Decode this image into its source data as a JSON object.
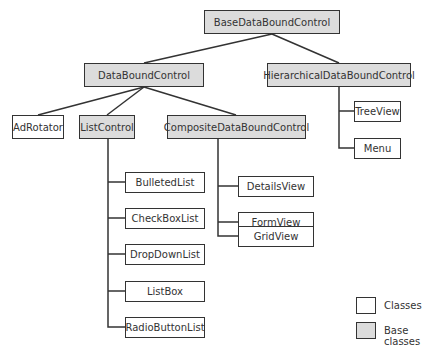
{
  "diagram": {
    "nodes": [
      {
        "id": "base",
        "label": "BaseDataBoundControl",
        "kind": "base",
        "x": 204,
        "y": 10,
        "w": 136,
        "h": 24
      },
      {
        "id": "dbc",
        "label": "DataBoundControl",
        "kind": "base",
        "x": 84,
        "y": 63,
        "w": 120,
        "h": 24
      },
      {
        "id": "hier",
        "label": "HierarchicalDataBoundControl",
        "kind": "base",
        "x": 267,
        "y": 63,
        "w": 144,
        "h": 24
      },
      {
        "id": "adrotator",
        "label": "AdRotator",
        "kind": "class",
        "x": 12,
        "y": 115,
        "w": 52,
        "h": 24
      },
      {
        "id": "listcontrol",
        "label": "ListControl",
        "kind": "base",
        "x": 79,
        "y": 115,
        "w": 56,
        "h": 24
      },
      {
        "id": "composite",
        "label": "CompositeDataBoundControl",
        "kind": "base",
        "x": 167,
        "y": 115,
        "w": 139,
        "h": 24
      },
      {
        "id": "treeview",
        "label": "TreeView",
        "kind": "class",
        "x": 354,
        "y": 101,
        "w": 47,
        "h": 21
      },
      {
        "id": "menu",
        "label": "Menu",
        "kind": "class",
        "x": 354,
        "y": 138,
        "w": 47,
        "h": 21
      },
      {
        "id": "detailsview",
        "label": "DetailsView",
        "kind": "class",
        "x": 238,
        "y": 176,
        "w": 76,
        "h": 21
      },
      {
        "id": "formview",
        "label": "FormView",
        "kind": "class",
        "x": 238,
        "y": 212,
        "w": 76,
        "h": 21
      },
      {
        "id": "gridview",
        "label": "GridView",
        "kind": "class",
        "x": 238,
        "y": 226,
        "w": 76,
        "h": 21
      },
      {
        "id": "bulletedlist",
        "label": "BulletedList",
        "kind": "class",
        "x": 125,
        "y": 172,
        "w": 80,
        "h": 21
      },
      {
        "id": "checkboxlist",
        "label": "CheckBoxList",
        "kind": "class",
        "x": 125,
        "y": 208,
        "w": 80,
        "h": 21
      },
      {
        "id": "dropdownlist",
        "label": "DropDownList",
        "kind": "class",
        "x": 125,
        "y": 244,
        "w": 80,
        "h": 21
      },
      {
        "id": "listbox",
        "label": "ListBox",
        "kind": "class",
        "x": 125,
        "y": 281,
        "w": 80,
        "h": 21
      },
      {
        "id": "radiobuttonlist",
        "label": "RadioButtonList",
        "kind": "class",
        "x": 125,
        "y": 317,
        "w": 80,
        "h": 21
      }
    ],
    "edges": [
      [
        "base",
        "dbc"
      ],
      [
        "base",
        "hier"
      ],
      [
        "dbc",
        "adrotator"
      ],
      [
        "dbc",
        "listcontrol"
      ],
      [
        "dbc",
        "composite"
      ],
      [
        "hier",
        "treeview"
      ],
      [
        "hier",
        "menu"
      ],
      [
        "composite",
        "detailsview"
      ],
      [
        "composite",
        "formview"
      ],
      [
        "composite",
        "gridview"
      ],
      [
        "listcontrol",
        "bulletedlist"
      ],
      [
        "listcontrol",
        "checkboxlist"
      ],
      [
        "listcontrol",
        "dropdownlist"
      ],
      [
        "listcontrol",
        "listbox"
      ],
      [
        "listcontrol",
        "radiobuttonlist"
      ]
    ]
  },
  "legend": {
    "classes_label": "Classes",
    "base_classes_label": "Base classes"
  },
  "colors": {
    "base_fill": "#dcdcdc",
    "class_fill": "#ffffff",
    "stroke": "#333333"
  }
}
